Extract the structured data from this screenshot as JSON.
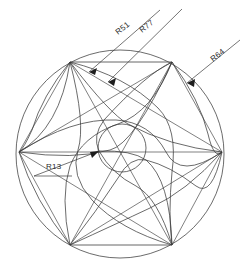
{
  "drawing": {
    "title": "Geometric construction drawing",
    "background_color": "#ffffff",
    "line_color": "#3a3a3a",
    "text_color": "#2b2b2b",
    "canvas": {
      "width": 242,
      "height": 280
    },
    "outer_circle": {
      "cx": 120,
      "cy": 154,
      "r": 104
    },
    "inner_circle": {
      "cx": 122,
      "cy": 148,
      "r": 24
    },
    "hexagon_vertices": [
      {
        "x": 70,
        "y": 62
      },
      {
        "x": 172,
        "y": 62
      },
      {
        "x": 222,
        "y": 152
      },
      {
        "x": 172,
        "y": 245
      },
      {
        "x": 70,
        "y": 245
      },
      {
        "x": 19,
        "y": 152
      }
    ]
  },
  "dimensions": [
    {
      "id": "r51",
      "label": "R51",
      "value": 51,
      "prefix": "R",
      "text_x": 118,
      "text_y": 35,
      "rotation": -38,
      "leader": {
        "x1": 160,
        "y1": 10,
        "x2": 89,
        "y2": 72
      },
      "arrow_at": {
        "x": 89,
        "y": 72
      },
      "arrow_angle": -139
    },
    {
      "id": "r77",
      "label": "R77",
      "value": 77,
      "prefix": "R",
      "text_x": 142,
      "text_y": 33,
      "rotation": -38,
      "leader": {
        "x1": 182,
        "y1": 9,
        "x2": 108,
        "y2": 82
      },
      "arrow_at": {
        "x": 108,
        "y": 82
      },
      "arrow_angle": -135
    },
    {
      "id": "r64",
      "label": "R64",
      "value": 64,
      "prefix": "R",
      "text_x": 213,
      "text_y": 62,
      "rotation": -38,
      "leader": {
        "x1": 240,
        "y1": 40,
        "x2": 187,
        "y2": 83
      },
      "arrow_at": {
        "x": 187,
        "y": 83
      },
      "arrow_angle": -141
    },
    {
      "id": "r13",
      "label": "R13",
      "value": 13,
      "prefix": "R",
      "text_x": 48,
      "text_y": 163,
      "rotation": 0,
      "leader": {
        "x1": 34,
        "y1": 176,
        "x2": 99,
        "y2": 151
      },
      "underline": {
        "x1": 34,
        "y1": 170,
        "x2": 72,
        "y2": 170
      },
      "arrow_at": {
        "x": 99,
        "y": 151
      },
      "arrow_angle": -21
    }
  ]
}
